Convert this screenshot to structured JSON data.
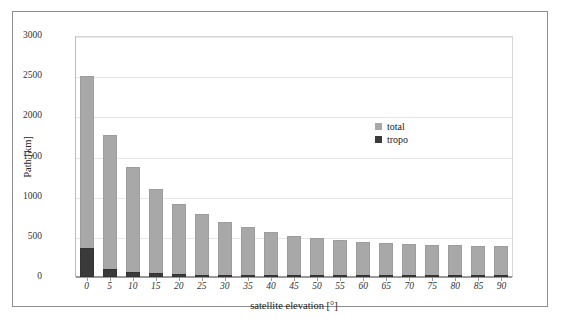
{
  "chart_data": {
    "type": "bar",
    "stacked": true,
    "title": "",
    "xlabel": "satellite elevation [°]",
    "ylabel": "Path [km]",
    "categories": [
      "0",
      "5",
      "10",
      "15",
      "20",
      "25",
      "30",
      "35",
      "40",
      "45",
      "50",
      "55",
      "60",
      "65",
      "70",
      "75",
      "80",
      "85",
      "90"
    ],
    "series": [
      {
        "name": "total",
        "color": "#a8a8a8",
        "values": [
          2505,
          1770,
          1370,
          1100,
          915,
          780,
          680,
          620,
          555,
          510,
          480,
          455,
          435,
          420,
          410,
          400,
          395,
          392,
          390
        ]
      },
      {
        "name": "tropo",
        "color": "#3a3a3a",
        "values": [
          355,
          105,
          65,
          45,
          35,
          28,
          24,
          20,
          18,
          16,
          15,
          14,
          13,
          12,
          11,
          11,
          10,
          10,
          10
        ]
      }
    ],
    "ylim": [
      0,
      3000
    ],
    "yticks": [
      "0",
      "500",
      "1000",
      "1500",
      "2000",
      "2500",
      "3000"
    ],
    "ytick_values": [
      0,
      500,
      1000,
      1500,
      2000,
      2500,
      3000
    ],
    "grid": "horizontal",
    "legend_position": "inside-upper-right",
    "legend_entries": [
      {
        "label": "total",
        "color": "#a8a8a8"
      },
      {
        "label": "tropo",
        "color": "#3a3a3a"
      }
    ]
  }
}
